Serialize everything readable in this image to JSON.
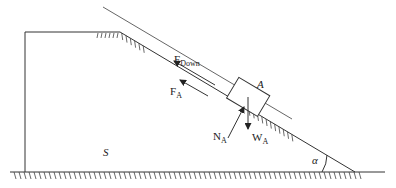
{
  "diagram": {
    "type": "inclined-plane-free-body",
    "labels": {
      "block": "A",
      "support": "S",
      "angle": "α",
      "force_down": {
        "main": "F",
        "sub": "Down"
      },
      "force_a": {
        "main": "F",
        "sub": "A"
      },
      "normal": {
        "main": "N",
        "sub": "A"
      },
      "weight": {
        "main": "W",
        "sub": "A"
      }
    },
    "colors": {
      "stroke": "#333333",
      "background": "#ffffff"
    }
  }
}
